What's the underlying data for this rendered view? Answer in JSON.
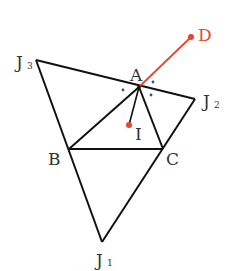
{
  "diagram": {
    "colors": {
      "line": "#111111",
      "accent": "#e8452c",
      "angle_dots": "#2b4fa8",
      "label": "#333333"
    },
    "points": {
      "A": {
        "label": "A",
        "x": 139,
        "y": 87
      },
      "B": {
        "label": "B",
        "x": 69,
        "y": 149
      },
      "C": {
        "label": "C",
        "x": 163,
        "y": 149
      },
      "I": {
        "label": "I",
        "x": 129,
        "y": 125
      },
      "D": {
        "label": "D",
        "x": 191,
        "y": 37
      },
      "J1": {
        "label": "J",
        "sub": "1",
        "x": 102,
        "y": 242
      },
      "J2": {
        "label": "J",
        "sub": "2",
        "x": 195,
        "y": 99
      },
      "J3": {
        "label": "J",
        "sub": "3",
        "x": 36,
        "y": 60
      }
    },
    "segments": [
      "J3-J2",
      "J3-J1",
      "J2-J1",
      "A-B",
      "A-C",
      "B-C",
      "A-I",
      "A-D"
    ]
  }
}
